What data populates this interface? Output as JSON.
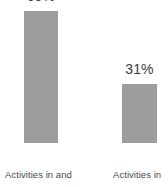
{
  "chart_data": {
    "type": "bar",
    "title": "",
    "subtitle": "",
    "xlabel": "",
    "ylabel": "",
    "categories": [
      "Activities in and",
      "Activities in"
    ],
    "values": [
      69,
      31
    ],
    "value_labels": [
      "69%",
      "31%"
    ],
    "units": "%",
    "ylim": [
      0,
      100
    ],
    "grid": false,
    "legend": false,
    "legend_position": "none",
    "bar_color": "#9d9d9d",
    "value_label_color": "#3b3b3b",
    "category_label_color": "#4a4a4a",
    "background_color": "#ffffff"
  }
}
